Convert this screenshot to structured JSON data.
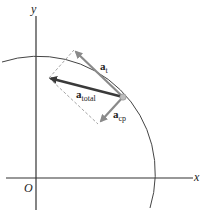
{
  "diagram": {
    "axes": {
      "x_label": "x",
      "y_label": "y",
      "origin_label": "O"
    },
    "vectors": {
      "tangential": {
        "symbol": "a",
        "subscript": "t"
      },
      "total": {
        "symbol": "a",
        "subscript": "total"
      },
      "centripetal": {
        "symbol": "a",
        "subscript": "cp"
      }
    },
    "colors": {
      "axis": "#333333",
      "arc": "#444444",
      "vector_total": "#3a3a3a",
      "vector_component": "#8a8a8a",
      "dashed": "#999999",
      "particle": "#bdbdbd"
    }
  }
}
